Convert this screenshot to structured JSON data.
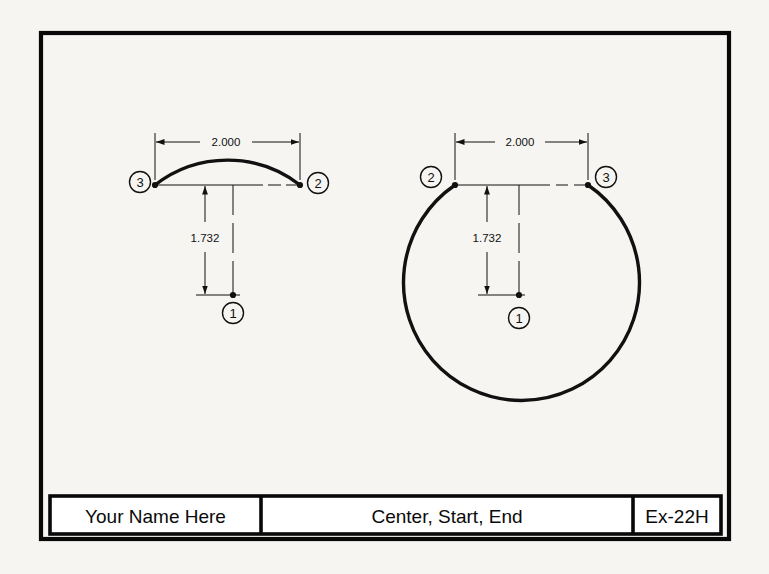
{
  "sheet": {
    "background_color": "#f6f5f2",
    "border_color": "#000000",
    "line_color": "#111111"
  },
  "title_block": {
    "name_field": "Your Name Here",
    "description_field": "Center, Start, End",
    "exercise_field": "Ex-22H"
  },
  "figures": [
    {
      "id": "left-arc-figure",
      "name": "minor-arc",
      "description": "Shallow arc drawn center-start-end, small included angle",
      "horizontal_dimension": "2.000",
      "vertical_dimension": "1.732",
      "points": [
        {
          "label": "1",
          "role": "center"
        },
        {
          "label": "2",
          "role": "end"
        },
        {
          "label": "3",
          "role": "start"
        }
      ]
    },
    {
      "id": "right-circle-figure",
      "name": "major-arc",
      "description": "Nearly full circle arc drawn center-start-end, large included angle",
      "horizontal_dimension": "2.000",
      "vertical_dimension": "1.732",
      "points": [
        {
          "label": "1",
          "role": "center"
        },
        {
          "label": "2",
          "role": "start"
        },
        {
          "label": "3",
          "role": "end"
        }
      ]
    }
  ]
}
